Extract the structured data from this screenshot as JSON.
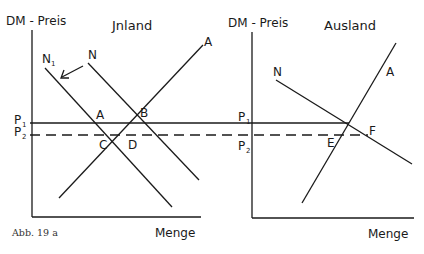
{
  "caption": "Abb. 19 a",
  "panels": [
    {
      "title": "Jnland",
      "y_axis_label": "DM - Preis",
      "x_axis_label": "Menge",
      "price_labels": {
        "p1": "P",
        "p1_sub": "1",
        "p2": "P",
        "p2_sub": "2"
      },
      "curves": {
        "demand_shifted": "N",
        "demand_shifted_sub": "1",
        "demand": "N",
        "supply": "A"
      },
      "points": {
        "a": "A",
        "b": "B",
        "c": "C",
        "d": "D"
      },
      "annotations": [
        "arrow from N to N1 (demand shift left)"
      ]
    },
    {
      "title": "Ausland",
      "y_axis_label": "DM - Preis",
      "x_axis_label": "Menge",
      "price_labels": {
        "p1": "P",
        "p1_sub": "1",
        "p2": "P",
        "p2_sub": "2"
      },
      "curves": {
        "demand": "N",
        "supply": "A"
      },
      "points": {
        "e": "E",
        "f": "F"
      }
    }
  ],
  "price_lines": {
    "p1": "solid",
    "p2": "dashed"
  }
}
